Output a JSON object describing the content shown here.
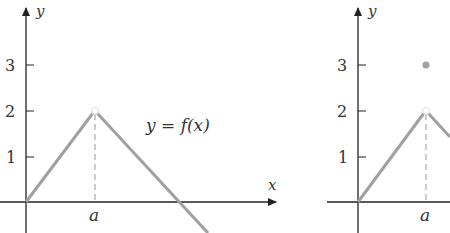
{
  "left_graph": {
    "y_axis_label": "y",
    "x_axis_label": "x",
    "ticks": [
      "3",
      "2",
      "1"
    ],
    "x_marker": "a",
    "function_label": "y = f(x)"
  },
  "right_graph": {
    "y_axis_label": "y",
    "ticks": [
      "3",
      "2",
      "1"
    ],
    "x_marker": "a"
  },
  "colors": {
    "axis": "#222222",
    "curve": "#a0a0a0",
    "dot": "#a0a0a0"
  }
}
